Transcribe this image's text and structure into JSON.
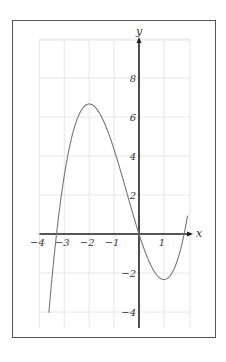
{
  "chart_data": {
    "type": "line",
    "title": "",
    "xlabel": "x",
    "ylabel": "y",
    "xlim": [
      -4,
      2
    ],
    "ylim": [
      -5,
      10
    ],
    "grid": true,
    "x_ticks": [
      -4,
      -3,
      -2,
      -1,
      1
    ],
    "x_tick_labels": [
      "−4",
      "−3",
      "−2",
      "−1",
      "1"
    ],
    "y_ticks": [
      -4,
      -2,
      2,
      4,
      6,
      8
    ],
    "y_tick_labels": [
      "−4",
      "−2",
      "2",
      "4",
      "6",
      "8"
    ],
    "series": [
      {
        "name": "f(x) = (2/3)x^3 + x^2 - 4x",
        "x": [
          -3.62,
          -3.5,
          -3.31,
          -3,
          -2.5,
          -2,
          -1.5,
          -1,
          -0.5,
          0,
          0.5,
          1,
          1.5,
          1.81,
          1.95
        ],
        "y": [
          -4.9,
          -3.33,
          0,
          3,
          5.83,
          6.67,
          6.0,
          4.33,
          2.17,
          0,
          -1.67,
          -2.33,
          -1.5,
          0,
          0.76
        ]
      }
    ],
    "key_points": {
      "local_max": [
        -2,
        6.67
      ],
      "local_min": [
        1,
        -2.33
      ],
      "roots": [
        -3.31,
        0,
        1.81
      ]
    }
  },
  "colors": {
    "curve": "#777777",
    "axis": "#222222",
    "grid": "#e6e6e6",
    "frame": "#555555"
  }
}
